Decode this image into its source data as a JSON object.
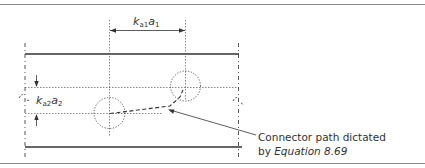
{
  "figure": {
    "dimension_top": {
      "var": "k",
      "sub1": "a1",
      "var2": "a",
      "sub2": "1"
    },
    "dimension_side": {
      "var": "k",
      "sub1": "a2",
      "var2": "a",
      "sub2": "2"
    },
    "annotation": {
      "line1": "Connector path dictated",
      "line2_prefix": "by ",
      "line2_ref": "Equation 8.69"
    }
  },
  "colors": {
    "line": "#333333",
    "border": "#8a8a8a",
    "dotted": "#555555"
  }
}
